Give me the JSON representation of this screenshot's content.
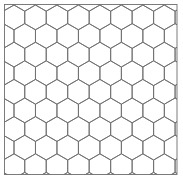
{
  "figure": {
    "width": 183,
    "height": 179,
    "background": "#ffffff",
    "line_color": "#6e6e6e",
    "line_width": 0.9,
    "frame": {
      "x": 4.5,
      "y": 4.5,
      "width": 172.5,
      "height": 170,
      "color": "#6e6e6e",
      "line_width": 0.9
    },
    "hex_grid": {
      "orientation": "pointy-top",
      "side": 12.4,
      "first_center_x": 14,
      "first_center_y": 17.4,
      "rows": 10,
      "cols": 10,
      "odd_row_offset": "half-width"
    }
  }
}
